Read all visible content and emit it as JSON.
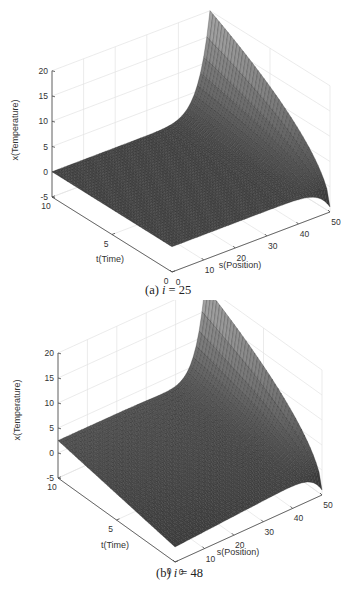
{
  "chart_data": [
    {
      "type": "surface",
      "caption_prefix": "(a)",
      "caption_var": "i",
      "caption_eq": "= 25",
      "i": 25,
      "title": "",
      "xlabel": "s(Position)",
      "ylabel": "t(Time)",
      "zlabel": "x(Temperature)",
      "xlim": [
        0,
        50
      ],
      "ylim": [
        0,
        10
      ],
      "zlim": [
        -5,
        20
      ],
      "xticks": [
        0,
        10,
        20,
        30,
        40,
        50
      ],
      "yticks": [
        0,
        5,
        10
      ],
      "zticks": [
        -5,
        0,
        5,
        10,
        15,
        20
      ],
      "grid": true,
      "colormap": "gray",
      "surface_description": "x(s,t): near 0 over most of domain; rises steeply near s=50, reaching ~20 at s=50,t=10 and ~-4 at s=50,t=0",
      "left_edge_slope": 0,
      "peak_value": 20,
      "corner_value_t0_s50": -4
    },
    {
      "type": "surface",
      "caption_prefix": "(b)",
      "caption_var": "i",
      "caption_eq": "= 48",
      "i": 48,
      "title": "",
      "xlabel": "s(Position)",
      "ylabel": "t(Time)",
      "zlabel": "x(Temperature)",
      "xlim": [
        0,
        50
      ],
      "ylim": [
        0,
        10
      ],
      "zlim": [
        -5,
        20
      ],
      "xticks": [
        0,
        10,
        20,
        30,
        40,
        50
      ],
      "yticks": [
        0,
        5,
        10
      ],
      "zticks": [
        -5,
        0,
        5,
        10,
        15,
        20
      ],
      "grid": true,
      "colormap": "gray",
      "surface_description": "x(s,t): gently rising with s and t; rises steeply near s=50, reaching ~20 at s=50,t=10 and ~-4 at s=50,t=0",
      "left_edge_slope": 2.5,
      "peak_value": 20,
      "corner_value_t0_s50": -4
    }
  ]
}
